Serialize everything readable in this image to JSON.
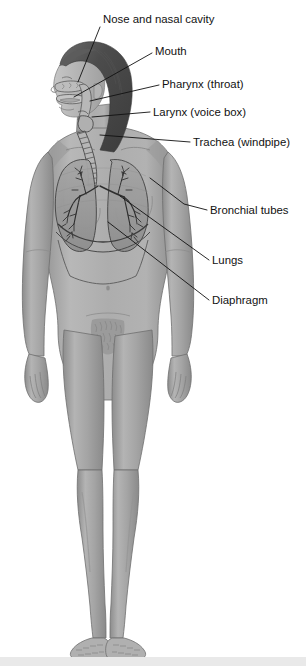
{
  "figure": {
    "background_color": "#ffffff",
    "line_color": "#111111",
    "skin_color": "#a8a8a8",
    "skin_shadow_color": "#8f8f8f",
    "skin_highlight_color": "#c2c2c2",
    "hair_color": "#4a4a4a",
    "lung_color": "#9a9a9a",
    "organ_outline_color": "#3a3a3a",
    "bottom_band_color": "#e9e9e9",
    "width": 306,
    "height": 666
  },
  "labels": [
    {
      "id": "nose-and-nasal-cavity",
      "text": "Nose and nasal cavity",
      "text_x": 103,
      "text_y": 23,
      "leader": "M 100 27 L 78 82"
    },
    {
      "id": "mouth",
      "text": "Mouth",
      "text_x": 155,
      "text_y": 55,
      "leader": "M 152 53 L 74 97"
    },
    {
      "id": "pharynx-throat",
      "text": "Pharynx (throat)",
      "text_x": 162,
      "text_y": 88,
      "leader": "M 159 85 L 90 101"
    },
    {
      "id": "larynx-voice-box",
      "text": "Larynx (voice box)",
      "text_x": 153,
      "text_y": 116,
      "leader": "M 150 112 L 92 117"
    },
    {
      "id": "trachea-windpipe",
      "text": "Trachea (windpipe)",
      "text_x": 193,
      "text_y": 146,
      "leader": "M 190 142 L 100 135"
    },
    {
      "id": "bronchial-tubes",
      "text": "Bronchial tubes",
      "text_x": 210,
      "text_y": 214,
      "leader": "M 207 210 L 184 204 L 150 178"
    },
    {
      "id": "lungs",
      "text": "Lungs",
      "text_x": 212,
      "text_y": 264,
      "leader": "M 209 260 L 120 196"
    },
    {
      "id": "diaphragm",
      "text": "Diaphragm",
      "text_x": 212,
      "text_y": 304,
      "leader": "M 209 300 L 108 222"
    }
  ],
  "anatomy_parts": [
    {
      "id": "head",
      "name": "head-profile"
    },
    {
      "id": "hair",
      "name": "hair"
    },
    {
      "id": "nasal-cavity",
      "name": "nasal-cavity"
    },
    {
      "id": "oral-cavity",
      "name": "oral-cavity"
    },
    {
      "id": "pharynx",
      "name": "pharynx"
    },
    {
      "id": "larynx",
      "name": "larynx"
    },
    {
      "id": "trachea",
      "name": "trachea"
    },
    {
      "id": "left-lung",
      "name": "left-lung"
    },
    {
      "id": "right-lung",
      "name": "right-lung"
    },
    {
      "id": "bronchial-tree",
      "name": "bronchial-tree"
    },
    {
      "id": "diaphragm",
      "name": "diaphragm"
    },
    {
      "id": "torso",
      "name": "torso"
    },
    {
      "id": "arms",
      "name": "arms"
    },
    {
      "id": "legs",
      "name": "legs"
    },
    {
      "id": "feet",
      "name": "feet"
    }
  ]
}
